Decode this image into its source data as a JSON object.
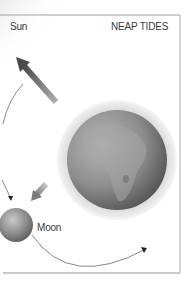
{
  "diagram": {
    "title": "NEAP TIDES",
    "labels": {
      "sun": "Sun",
      "moon": "Moon"
    },
    "bodies": [
      {
        "name": "Sun",
        "position": "top-left, partially off-frame",
        "rendering": "soft grey glow"
      },
      {
        "name": "Earth",
        "position": "center-right",
        "rendering": "grey globe showing Africa, with light halo"
      },
      {
        "name": "Moon",
        "position": "lower-left",
        "rendering": "small shaded grey sphere"
      }
    ],
    "arrows": [
      {
        "from": "Earth",
        "to": "Sun",
        "style": "thick grey gradient arrow"
      },
      {
        "from": "Earth",
        "to": "Moon",
        "style": "short thick grey arrow"
      }
    ],
    "orbit_path": {
      "description": "thin curved line arcing around Earth with arrowheads indicating Moon's orbital direction"
    },
    "colors": {
      "border": "#8a8a8a",
      "text": "#3a3a3a",
      "earth_dark": "#5a5a5a",
      "earth_light": "#b5b5b5",
      "halo": "#e6e6e6",
      "arrow": "#6e6e6e",
      "orbit_line": "#555555"
    }
  }
}
